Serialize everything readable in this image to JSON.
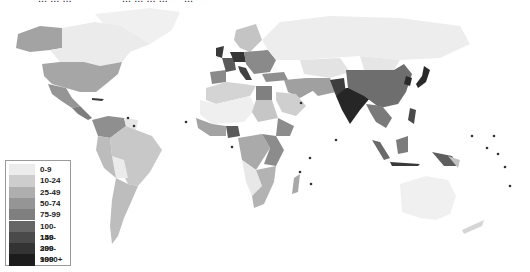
{
  "title_fragments": [
    "... ... ...",
    "... ... ... ...",
    "..."
  ],
  "map": {
    "type": "choropleth",
    "subject": "population density by country (grayscale)",
    "ocean_color": "#ffffff",
    "regions": [
      {
        "name": "Alaska",
        "class": "50-74",
        "color": "#a6a6a6"
      },
      {
        "name": "Canada",
        "class": "0-9",
        "color": "#ebebeb"
      },
      {
        "name": "Greenland",
        "class": "0-9",
        "color": "#f2f2f2"
      },
      {
        "name": "United States",
        "class": "25-49",
        "color": "#a6a6a6"
      },
      {
        "name": "Mexico",
        "class": "50-74",
        "color": "#959595"
      },
      {
        "name": "Central America",
        "class": "75-99",
        "color": "#7f7f7f"
      },
      {
        "name": "Caribbean",
        "class": "150-299",
        "color": "#3c3c3c"
      },
      {
        "name": "Colombia/Venezuela",
        "class": "25-49",
        "color": "#8f8f8f"
      },
      {
        "name": "Guianas",
        "class": "0-9",
        "color": "#e6e6e6"
      },
      {
        "name": "Brazil",
        "class": "10-24",
        "color": "#c8c8c8"
      },
      {
        "name": "Bolivia",
        "class": "0-9",
        "color": "#ebebeb"
      },
      {
        "name": "Argentina/Chile",
        "class": "10-24",
        "color": "#bdbdbd"
      },
      {
        "name": "Scandinavia",
        "class": "10-24",
        "color": "#c4c4c4"
      },
      {
        "name": "Western Europe",
        "class": "100-149",
        "color": "#5a5a5a"
      },
      {
        "name": "UK/Benelux/Germany/Italy",
        "class": "150-299",
        "color": "#3a3a3a"
      },
      {
        "name": "Eastern Europe",
        "class": "75-99",
        "color": "#8a8a8a"
      },
      {
        "name": "Russia",
        "class": "0-9",
        "color": "#ededed"
      },
      {
        "name": "Kazakhstan/Central Asia",
        "class": "0-9",
        "color": "#e3e3e3"
      },
      {
        "name": "Middle East",
        "class": "25-49",
        "color": "#a0a0a0"
      },
      {
        "name": "Saudi Arabia",
        "class": "10-24",
        "color": "#cfcfcf"
      },
      {
        "name": "North Africa",
        "class": "10-24",
        "color": "#d4d4d4"
      },
      {
        "name": "Sahara",
        "class": "0-9",
        "color": "#efefef"
      },
      {
        "name": "Egypt",
        "class": "75-99",
        "color": "#808080"
      },
      {
        "name": "West Africa",
        "class": "50-74",
        "color": "#a3a3a3"
      },
      {
        "name": "Nigeria",
        "class": "150-299",
        "color": "#5a5a5a"
      },
      {
        "name": "Central Africa",
        "class": "25-49",
        "color": "#aaaaaa"
      },
      {
        "name": "East Africa",
        "class": "75-99",
        "color": "#8c8c8c"
      },
      {
        "name": "Southern Africa",
        "class": "25-49",
        "color": "#b3b3b3"
      },
      {
        "name": "Namibia/Botswana",
        "class": "0-9",
        "color": "#e8e8e8"
      },
      {
        "name": "Madagascar",
        "class": "25-49",
        "color": "#a8a8a8"
      },
      {
        "name": "India",
        "class": "300-999",
        "color": "#262626"
      },
      {
        "name": "Pakistan",
        "class": "150-299",
        "color": "#3e3e3e"
      },
      {
        "name": "China",
        "class": "100-149",
        "color": "#6e6e6e"
      },
      {
        "name": "Mongolia",
        "class": "0-9",
        "color": "#e6e6e6"
      },
      {
        "name": "Korea/Japan",
        "class": "300-999",
        "color": "#2a2a2a"
      },
      {
        "name": "Southeast Asia",
        "class": "75-99",
        "color": "#7a7a7a"
      },
      {
        "name": "Indonesia",
        "class": "100-149",
        "color": "#6a6a6a"
      },
      {
        "name": "Papua New Guinea",
        "class": "10-24",
        "color": "#c2c2c2"
      },
      {
        "name": "Australia",
        "class": "0-9",
        "color": "#f0f0f0"
      },
      {
        "name": "New Zealand",
        "class": "10-24",
        "color": "#d6d6d6"
      }
    ]
  },
  "legend": {
    "title": "",
    "items": [
      {
        "label": "0-9",
        "color": "#ececec"
      },
      {
        "label": "10-24",
        "color": "#cdcdcd"
      },
      {
        "label": "25-49",
        "color": "#aeaeae"
      },
      {
        "label": "50-74",
        "color": "#959595"
      },
      {
        "label": "75-99",
        "color": "#7f7f7f"
      },
      {
        "label": "100-149",
        "color": "#666666"
      },
      {
        "label": "150-299",
        "color": "#4a4a4a"
      },
      {
        "label": "300-999",
        "color": "#333333"
      },
      {
        "label": "1000+",
        "color": "#1c1c1c"
      }
    ]
  }
}
